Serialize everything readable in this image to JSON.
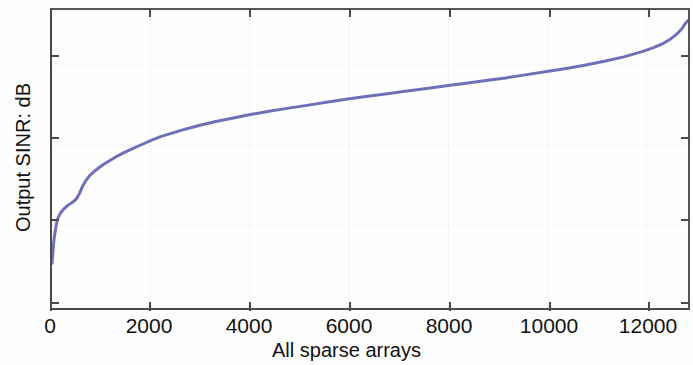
{
  "chart_data": {
    "type": "line",
    "title": "",
    "subtitle": "",
    "xlabel": "All sparse arrays",
    "ylabel": "Output SINR: dB",
    "xlim": [
      0,
      12900
    ],
    "ylim": [
      2,
      8.8
    ],
    "xticks": [
      0,
      2000,
      4000,
      6000,
      8000,
      10000,
      12000
    ],
    "xticklabels": [
      "0",
      "2000",
      "4000",
      "6000",
      "8000",
      "10000",
      "12000"
    ],
    "yticks": [
      2,
      4,
      6,
      8
    ],
    "yticklabels": [
      "2",
      "4",
      "6",
      "8"
    ],
    "grid": false,
    "legend": null,
    "series": [
      {
        "name": "Output SINR (sorted)",
        "color": "#6f6fba",
        "linewidth": 3,
        "x": [
          0,
          20,
          40,
          60,
          80,
          100,
          120,
          150,
          180,
          210,
          240,
          280,
          320,
          360,
          400,
          450,
          500,
          560,
          620,
          700,
          780,
          860,
          950,
          1050,
          1150,
          1300,
          1450,
          1600,
          1800,
          2000,
          2200,
          2400,
          2700,
          3000,
          3300,
          3600,
          4000,
          4400,
          4800,
          5200,
          5600,
          6000,
          6400,
          6800,
          7200,
          7600,
          8000,
          8400,
          8800,
          9200,
          9600,
          10000,
          10400,
          10800,
          11200,
          11600,
          12000,
          12200,
          12400,
          12550,
          12680,
          12780,
          12850,
          12900
        ],
        "y": [
          3.02,
          3.3,
          3.55,
          3.72,
          3.86,
          3.97,
          4.05,
          4.12,
          4.18,
          4.22,
          4.26,
          4.3,
          4.34,
          4.37,
          4.4,
          4.44,
          4.5,
          4.62,
          4.78,
          4.93,
          5.04,
          5.12,
          5.2,
          5.28,
          5.35,
          5.45,
          5.54,
          5.62,
          5.72,
          5.82,
          5.91,
          5.98,
          6.08,
          6.17,
          6.25,
          6.32,
          6.41,
          6.49,
          6.56,
          6.63,
          6.7,
          6.77,
          6.83,
          6.89,
          6.95,
          7.01,
          7.07,
          7.13,
          7.19,
          7.25,
          7.32,
          7.39,
          7.46,
          7.54,
          7.63,
          7.73,
          7.86,
          7.94,
          8.04,
          8.14,
          8.26,
          8.38,
          8.5,
          8.56
        ]
      }
    ],
    "annotations": [],
    "data_range": {
      "x_min": 0,
      "x_max": 12900,
      "y_min": 3.02,
      "y_max": 8.56
    },
    "description_values": {
      "start_sinr_db": 3.02,
      "end_sinr_db": 8.56,
      "knee_sinr_db": 4.4,
      "knee_array_index": 450,
      "total_sparse_arrays": 12900
    }
  }
}
